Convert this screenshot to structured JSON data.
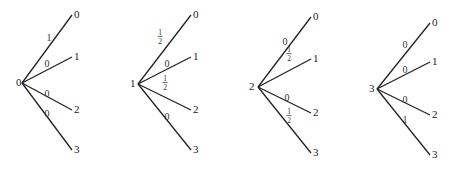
{
  "diagram": {
    "trees": [
      {
        "root": "0",
        "root_xy": [
          16,
          86
        ],
        "origin": [
          22,
          83
        ],
        "x_end": 72,
        "branches": [
          {
            "target": "0",
            "prob": "1",
            "end_y": 15
          },
          {
            "target": "1",
            "prob": "0",
            "end_y": 57
          },
          {
            "target": "2",
            "prob": "0",
            "end_y": 110
          },
          {
            "target": "3",
            "prob": "0",
            "end_y": 150
          }
        ],
        "label_pos": [
          [
            49,
            38
          ],
          [
            47,
            64
          ],
          [
            47,
            94
          ],
          [
            47,
            114
          ]
        ]
      },
      {
        "root": "1",
        "root_xy": [
          130,
          87
        ],
        "origin": [
          138,
          84
        ],
        "x_end": 191,
        "branches": [
          {
            "target": "0",
            "prob": "1/2",
            "end_y": 15
          },
          {
            "target": "1",
            "prob": "0",
            "end_y": 57
          },
          {
            "target": "2",
            "prob": "1/2",
            "end_y": 110
          },
          {
            "target": "3",
            "prob": "0",
            "end_y": 150
          }
        ],
        "label_pos": [
          [
            160,
            38
          ],
          [
            167,
            64
          ],
          [
            165,
            84
          ],
          [
            167,
            117
          ]
        ]
      },
      {
        "root": "2",
        "root_xy": [
          249,
          90
        ],
        "origin": [
          258,
          87
        ],
        "x_end": 311,
        "branches": [
          {
            "target": "0",
            "prob": "0",
            "end_y": 17
          },
          {
            "target": "1",
            "prob": "1/2",
            "end_y": 59
          },
          {
            "target": "2",
            "prob": "0",
            "end_y": 113
          },
          {
            "target": "3",
            "prob": "1/2",
            "end_y": 153
          }
        ],
        "label_pos": [
          [
            285,
            42
          ],
          [
            289,
            55
          ],
          [
            287,
            98
          ],
          [
            289,
            117
          ]
        ],
        "label_pos_note": "labels above line for 0 and below for 1/2"
      },
      {
        "root": "3",
        "root_xy": [
          369,
          92
        ],
        "origin": [
          377,
          89
        ],
        "x_end": 430,
        "branches": [
          {
            "target": "0",
            "prob": "0",
            "end_y": 23
          },
          {
            "target": "1",
            "prob": "0",
            "end_y": 62
          },
          {
            "target": "2",
            "prob": "0",
            "end_y": 115
          },
          {
            "target": "3",
            "prob": "1",
            "end_y": 155
          }
        ],
        "label_pos": [
          [
            405,
            45
          ],
          [
            405,
            70
          ],
          [
            405,
            100
          ],
          [
            405,
            120
          ]
        ]
      }
    ]
  }
}
